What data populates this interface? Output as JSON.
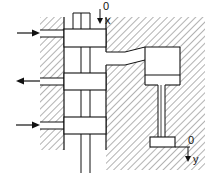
{
  "diagram": {
    "type": "hydraulic spool valve with actuator cylinder",
    "labels": {
      "spool_origin": "0",
      "spool_axis": "x",
      "piston_origin": "0",
      "piston_axis": "y"
    },
    "ports": [
      {
        "name": "supply-top",
        "direction": "in"
      },
      {
        "name": "return-middle",
        "direction": "out"
      },
      {
        "name": "supply-bottom",
        "direction": "in"
      }
    ],
    "colors": {
      "line": "#111111",
      "hatch": "#444444",
      "background": "#ffffff"
    }
  }
}
